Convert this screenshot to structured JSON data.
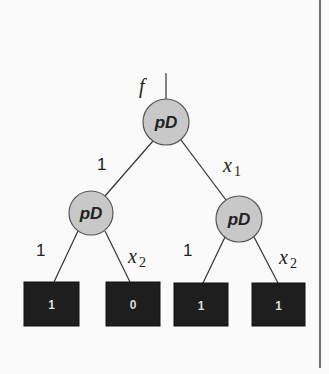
{
  "diagram": {
    "type": "decision-diagram",
    "root_label": "f",
    "border_line": {
      "x": 320,
      "y1": 0,
      "y2": 368
    },
    "input_edge": {
      "x": 166,
      "y1": 73,
      "y2": 99
    },
    "nodes": [
      {
        "id": "root",
        "label": "pD",
        "cx": 166,
        "cy": 122,
        "r": 23
      },
      {
        "id": "left",
        "label": "pD",
        "cx": 91,
        "cy": 213,
        "r": 22
      },
      {
        "id": "right",
        "label": "pD",
        "cx": 239,
        "cy": 219,
        "r": 23
      }
    ],
    "leaves": [
      {
        "id": "leaf1",
        "value": "1",
        "x": 24,
        "y": 282,
        "w": 55,
        "h": 44
      },
      {
        "id": "leaf2",
        "value": "0",
        "x": 106,
        "y": 282,
        "w": 54,
        "h": 44
      },
      {
        "id": "leaf3",
        "value": "1",
        "x": 174,
        "y": 283,
        "w": 54,
        "h": 43
      },
      {
        "id": "leaf4",
        "value": "1",
        "x": 252,
        "y": 283,
        "w": 53,
        "h": 43
      }
    ],
    "edges": [
      {
        "from": "root",
        "to": "left",
        "x1": 153,
        "y1": 141,
        "x2": 105,
        "y2": 196,
        "label": "1",
        "label_type": "plain",
        "lx": 97,
        "ly": 170
      },
      {
        "from": "root",
        "to": "right",
        "x1": 181,
        "y1": 140,
        "x2": 226,
        "y2": 200,
        "label": "x",
        "sub": "1",
        "label_type": "math",
        "lx": 223,
        "ly": 172
      },
      {
        "from": "left",
        "to": "leaf1",
        "x1": 78,
        "y1": 231,
        "x2": 54,
        "y2": 282,
        "label": "1",
        "label_type": "plain",
        "lx": 36,
        "ly": 256
      },
      {
        "from": "left",
        "to": "leaf2",
        "x1": 105,
        "y1": 231,
        "x2": 130,
        "y2": 282,
        "label": "x",
        "sub": "2",
        "label_type": "math",
        "lx": 128,
        "ly": 263
      },
      {
        "from": "right",
        "to": "leaf3",
        "x1": 225,
        "y1": 237,
        "x2": 203,
        "y2": 283,
        "label": "1",
        "label_type": "plain",
        "lx": 183,
        "ly": 256
      },
      {
        "from": "right",
        "to": "leaf4",
        "x1": 254,
        "y1": 237,
        "x2": 278,
        "y2": 283,
        "label": "x",
        "sub": "2",
        "label_type": "math",
        "lx": 279,
        "ly": 264
      }
    ]
  }
}
